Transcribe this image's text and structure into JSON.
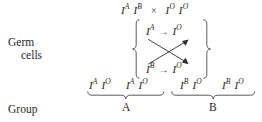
{
  "figure": {
    "type": "genetics-cross-diagram",
    "background_color": "#ffffff",
    "ink_color": "#1f1f1f"
  },
  "row_labels": {
    "germ_cells_line1": "Germ",
    "germ_cells_line2": "cells",
    "group": "Group"
  },
  "parents": {
    "mother": {
      "allele1_base": "I",
      "allele1_sup": "A",
      "allele2_base": "I",
      "allele2_sup": "B"
    },
    "cross_symbol": "×",
    "father": {
      "allele1_base": "I",
      "allele1_sup": "O",
      "allele2_base": "I",
      "allele2_sup": "O"
    }
  },
  "gametes": {
    "top_row": {
      "left_base": "I",
      "left_sup": "A",
      "arrow": "→",
      "right_base": "I",
      "right_sup": "O"
    },
    "bottom_row": {
      "left_base": "I",
      "left_sup": "B",
      "arrow": "→",
      "right_base": "I",
      "right_sup": "O"
    }
  },
  "offspring": [
    {
      "allele1_base": "I",
      "allele1_sup": "A",
      "allele2_base": "I",
      "allele2_sup": "O"
    },
    {
      "allele1_base": "I",
      "allele1_sup": "A",
      "allele2_base": "I",
      "allele2_sup": "O"
    },
    {
      "allele1_base": "I",
      "allele1_sup": "B",
      "allele2_base": "I",
      "allele2_sup": "O"
    },
    {
      "allele1_base": "I",
      "allele1_sup": "B",
      "allele2_base": "I",
      "allele2_sup": "O"
    }
  ],
  "groups": [
    {
      "label": "A"
    },
    {
      "label": "B"
    }
  ]
}
